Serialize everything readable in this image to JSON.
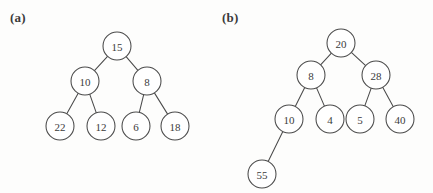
{
  "figure": {
    "width": 433,
    "height": 193,
    "background_color": "#fdfdfc",
    "stroke_color": "#4a4a4a",
    "node_fill_color": "#ffffff",
    "text_color": "#3b3b3b"
  },
  "panels": [
    {
      "id": "a",
      "label": "(a)",
      "label_x": 10,
      "label_y": 10,
      "node_radius": 14,
      "nodes": [
        {
          "id": "a0",
          "value": "15",
          "cx": 117,
          "cy": 46
        },
        {
          "id": "a1",
          "value": "10",
          "cx": 85,
          "cy": 81
        },
        {
          "id": "a2",
          "value": "8",
          "cx": 147,
          "cy": 81
        },
        {
          "id": "a3",
          "value": "22",
          "cx": 60,
          "cy": 126
        },
        {
          "id": "a4",
          "value": "12",
          "cx": 101,
          "cy": 126
        },
        {
          "id": "a5",
          "value": "6",
          "cx": 136,
          "cy": 126
        },
        {
          "id": "a6",
          "value": "18",
          "cx": 175,
          "cy": 126
        }
      ],
      "edges": [
        {
          "from": "a0",
          "to": "a1"
        },
        {
          "from": "a0",
          "to": "a2"
        },
        {
          "from": "a1",
          "to": "a3"
        },
        {
          "from": "a1",
          "to": "a4"
        },
        {
          "from": "a2",
          "to": "a5"
        },
        {
          "from": "a2",
          "to": "a6"
        }
      ]
    },
    {
      "id": "b",
      "label": "(b)",
      "label_x": 222,
      "label_y": 10,
      "node_radius": 14,
      "nodes": [
        {
          "id": "b0",
          "value": "20",
          "cx": 341,
          "cy": 43
        },
        {
          "id": "b1",
          "value": "8",
          "cx": 311,
          "cy": 75
        },
        {
          "id": "b2",
          "value": "28",
          "cx": 376,
          "cy": 75
        },
        {
          "id": "b3",
          "value": "10",
          "cx": 289,
          "cy": 119
        },
        {
          "id": "b4",
          "value": "4",
          "cx": 330,
          "cy": 119
        },
        {
          "id": "b5",
          "value": "5",
          "cx": 360,
          "cy": 119
        },
        {
          "id": "b6",
          "value": "40",
          "cx": 400,
          "cy": 119
        },
        {
          "id": "b7",
          "value": "55",
          "cx": 262,
          "cy": 174
        }
      ],
      "edges": [
        {
          "from": "b0",
          "to": "b1"
        },
        {
          "from": "b0",
          "to": "b2"
        },
        {
          "from": "b1",
          "to": "b3"
        },
        {
          "from": "b1",
          "to": "b4"
        },
        {
          "from": "b2",
          "to": "b5"
        },
        {
          "from": "b2",
          "to": "b6"
        },
        {
          "from": "b3",
          "to": "b7"
        }
      ]
    }
  ]
}
